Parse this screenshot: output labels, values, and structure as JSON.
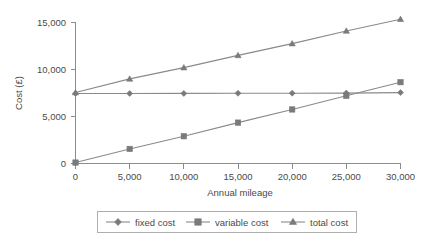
{
  "chart_data": {
    "type": "line",
    "title": "",
    "xlabel": "Annual mileage",
    "ylabel": "Cost (£)",
    "x": [
      0,
      5000,
      10000,
      15000,
      20000,
      25000,
      30000
    ],
    "xtick_labels": [
      "0",
      "5,000",
      "10,000",
      "15,000",
      "20,000",
      "25,000",
      "30,000"
    ],
    "ytick_labels": [
      "0",
      "5,000",
      "10,000",
      "15,000"
    ],
    "ytick_values": [
      0,
      5000,
      10000,
      15000
    ],
    "xlim": [
      0,
      30000
    ],
    "ylim": [
      0,
      15000
    ],
    "grid": false,
    "legend_position": "bottom",
    "series": [
      {
        "name": "fixed cost",
        "marker": "diamond",
        "color": "#7a7a7a",
        "values": [
          7450,
          7450,
          7460,
          7470,
          7480,
          7490,
          7540
        ]
      },
      {
        "name": "variable cost",
        "marker": "square",
        "color": "#7a7a7a",
        "values": [
          100,
          1550,
          2900,
          4350,
          5750,
          7200,
          8650
        ]
      },
      {
        "name": "total cost",
        "marker": "triangle",
        "color": "#7a7a7a",
        "values": [
          7550,
          9000,
          10200,
          11500,
          12750,
          14100,
          15350
        ]
      }
    ]
  },
  "legend": {
    "entries": [
      {
        "label": "fixed cost",
        "marker": "diamond"
      },
      {
        "label": "variable cost",
        "marker": "square"
      },
      {
        "label": "total cost",
        "marker": "triangle"
      }
    ]
  },
  "colors": {
    "axis": "#8c8c8c",
    "series": "#7a7a7a",
    "text": "#4a4a4a",
    "legend_border": "#aeaeae",
    "background": "#ffffff"
  }
}
